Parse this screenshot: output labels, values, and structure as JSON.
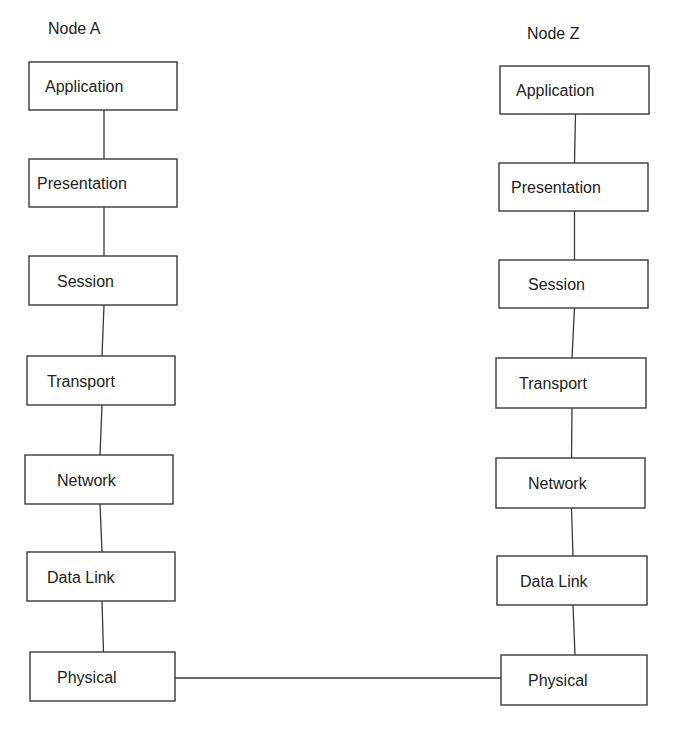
{
  "diagram": {
    "nodes": [
      {
        "id": "node-a",
        "title": "Node A",
        "layers": [
          "Application",
          "Presentation",
          "Session",
          "Transport",
          "Network",
          "Data Link",
          "Physical"
        ]
      },
      {
        "id": "node-z",
        "title": "Node Z",
        "layers": [
          "Application",
          "Presentation",
          "Session",
          "Transport",
          "Network",
          "Data Link",
          "Physical"
        ]
      }
    ],
    "connections": [
      {
        "from": "node-a.Physical",
        "to": "node-z.Physical"
      }
    ],
    "colors": {
      "background": "#ffffff",
      "stroke": "#3a3a3a",
      "text": "#222222"
    }
  }
}
